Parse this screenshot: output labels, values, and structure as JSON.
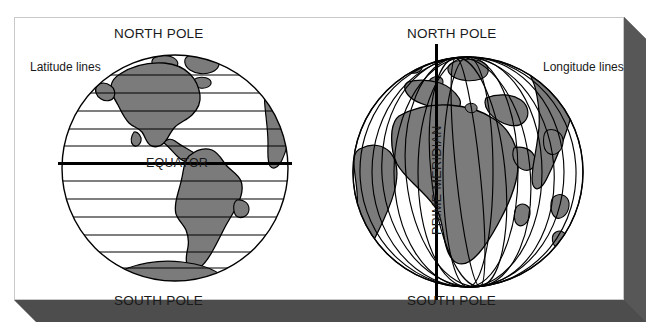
{
  "figure": {
    "type": "educational-diagram",
    "background_color": "#ffffff",
    "panel": {
      "border_color": "#c9c9c9",
      "fill_color": "#ffffff",
      "shadow_color": "#4d4d4d"
    },
    "land_color": "#7b7b7b",
    "line_color": "#000000"
  },
  "globes": {
    "left": {
      "name": "latitude-globe",
      "side_label": "Latitude lines",
      "top_label": "NORTH POLE",
      "bottom_label": "SOUTH POLE",
      "axis_label": "EQUATOR",
      "grid_type": "latitude",
      "parallel_count": 12,
      "hemisphere_shown": "Western Hemisphere (Americas)"
    },
    "right": {
      "name": "longitude-globe",
      "side_label": "Longitude lines",
      "top_label": "NORTH POLE",
      "bottom_label": "SOUTH POLE",
      "axis_label": "PRIME MERIDIAN",
      "grid_type": "longitude",
      "meridian_count": 11,
      "hemisphere_shown": "Eastern Hemisphere (Africa, Europe, Asia)"
    }
  }
}
